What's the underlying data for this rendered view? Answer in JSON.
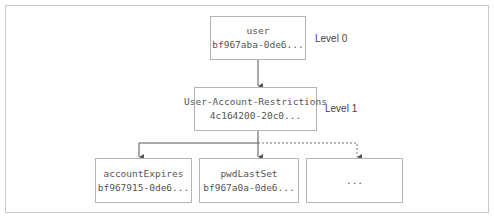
{
  "diagram": {
    "levels": [
      {
        "label": "Level 0"
      },
      {
        "label": "Level 1"
      }
    ],
    "nodes": {
      "root": {
        "name": "user",
        "id": "bf967aba-0de6..."
      },
      "mid": {
        "name": "User-Account-Restrictions",
        "id": "4c164200-20c0..."
      },
      "child1": {
        "name": "accountExpires",
        "id": "bf967915-0de6..."
      },
      "child2": {
        "name": "pwdLastSet",
        "id": "bf967a0a-0de6..."
      },
      "child3": {
        "name": "..."
      }
    },
    "colors": {
      "line": "#555555",
      "border": "#b4b4b4",
      "text": "#555555"
    }
  }
}
